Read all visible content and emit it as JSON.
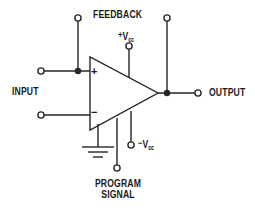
{
  "diagram": {
    "background_color": "#ffffff",
    "line_color": "#262626"
  },
  "labels": {
    "feedback": "FEEDBACK",
    "input": "INPUT",
    "output": "OUTPUT",
    "program_signal_line1": "PROGRAM",
    "program_signal_line2": "SIGNAL",
    "vcc_positive_sign": "+",
    "vcc_positive_symbol": "V",
    "vcc_positive_subscript": "cc",
    "vcc_negative_sign": "−",
    "vcc_negative_symbol": "V",
    "vcc_negative_subscript": "cc",
    "noninverting_input": "+",
    "inverting_input": "−"
  },
  "terminals": [
    {
      "name": "feedback-top-terminal",
      "x": 78,
      "y": 18
    },
    {
      "name": "vcc-positive-terminal",
      "x": 129,
      "y": 46
    },
    {
      "name": "output-branch-terminal",
      "x": 167,
      "y": 18
    },
    {
      "name": "input-noninverting-terminal",
      "x": 41,
      "y": 71
    },
    {
      "name": "input-inverting-terminal",
      "x": 41,
      "y": 115
    },
    {
      "name": "output-terminal",
      "x": 198,
      "y": 93
    },
    {
      "name": "vcc-negative-terminal",
      "x": 131,
      "y": 145
    },
    {
      "name": "program-signal-terminal",
      "x": 117,
      "y": 168
    }
  ],
  "junctions": [
    {
      "name": "feedback-input-junction",
      "x": 78,
      "y": 71
    },
    {
      "name": "output-junction",
      "x": 167,
      "y": 93
    }
  ],
  "opamp": {
    "name": "operational-amplifier",
    "apex_x": 158,
    "apex_y": 93,
    "left_x": 90,
    "top_y": 57,
    "bottom_y": 130
  },
  "ground": {
    "name": "ground-symbol",
    "x": 98,
    "top_y": 122,
    "bars": [
      16,
      10,
      5
    ]
  }
}
